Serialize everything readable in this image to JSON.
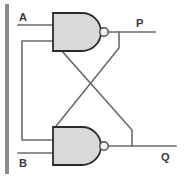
{
  "figure": {
    "kind": "logic-circuit-diagram",
    "name": "SR latch built from two cross-coupled NAND gates",
    "width": 184,
    "height": 177,
    "background_color": "#ffffff"
  },
  "colors": {
    "wire": "#6b6b6b",
    "gate_outline": "#2b2b2b",
    "gate_fill": "#d9d9d9",
    "bubble_fill": "#f2f2f2",
    "bubble_outline": "#4a4a4a",
    "label_text": "#3a3a3a",
    "edge_bar": "#8c8c8c"
  },
  "labels": {
    "input_a": "A",
    "input_b": "B",
    "output_p": "P",
    "output_q": "Q"
  },
  "gates": [
    {
      "id": "nand-top",
      "type": "NAND",
      "inputs": [
        "A",
        "Q"
      ],
      "output": "P"
    },
    {
      "id": "nand-bottom",
      "type": "NAND",
      "inputs": [
        "P",
        "B"
      ],
      "output": "Q"
    }
  ],
  "nets": [
    {
      "id": "net-a-in",
      "from": "A",
      "to": "nand-top.in1"
    },
    {
      "id": "net-b-in",
      "from": "B",
      "to": "nand-bottom.in2"
    },
    {
      "id": "net-p-out",
      "from": "nand-top.out",
      "to": "P"
    },
    {
      "id": "net-q-out",
      "from": "nand-bottom.out",
      "to": "Q"
    },
    {
      "id": "net-p-to-bottom",
      "from": "nand-top.out",
      "to": "nand-bottom.in1"
    },
    {
      "id": "net-q-to-top",
      "from": "nand-bottom.out",
      "to": "nand-top.in2"
    }
  ],
  "edge_artifact": {
    "present": true,
    "side": "left"
  }
}
